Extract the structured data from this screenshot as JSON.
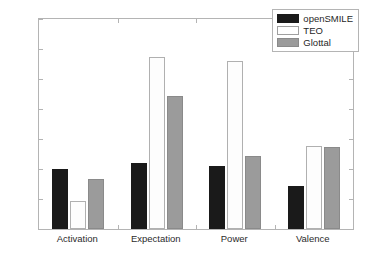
{
  "chart_data": {
    "type": "bar",
    "title": "",
    "xlabel": "",
    "ylabel": "",
    "ylim": [
      0,
      0.7
    ],
    "yticks": [
      "0",
      "0.1",
      "0.2",
      "0.3",
      "0.4",
      "0.5",
      "0.6",
      "0.7"
    ],
    "ytick_values": [
      0,
      0.1,
      0.2,
      0.3,
      0.4,
      0.5,
      0.6,
      0.7
    ],
    "grid": false,
    "legend_position": "top-right",
    "categories": [
      "Activation",
      "Expectation",
      "Power",
      "Valence"
    ],
    "series": [
      {
        "name": "openSMILE",
        "color": "#1a1a1a",
        "values": [
          0.199,
          0.221,
          0.209,
          0.145
        ]
      },
      {
        "name": "TEO",
        "color": "#ffffff",
        "values": [
          0.093,
          0.574,
          0.561,
          0.276
        ]
      },
      {
        "name": "Glottal",
        "color": "#9b9b9b",
        "values": [
          0.167,
          0.445,
          0.245,
          0.275
        ]
      }
    ]
  },
  "legend": {
    "items": [
      {
        "label": "openSMILE"
      },
      {
        "label": "TEO"
      },
      {
        "label": "Glottal"
      }
    ]
  }
}
